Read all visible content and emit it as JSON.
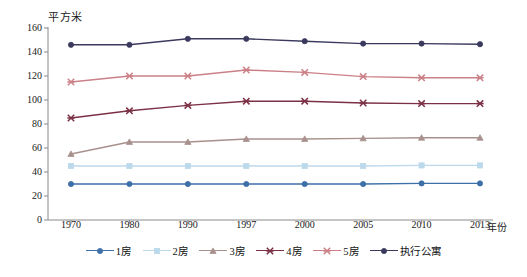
{
  "chart_data": {
    "type": "line",
    "title": "",
    "xlabel": "年份",
    "ylabel": "平方米",
    "grid": false,
    "legend_position": "bottom",
    "categories": [
      "1970",
      "1980",
      "1990",
      "1997",
      "2000",
      "2005",
      "2010",
      "2013"
    ],
    "ylim": [
      0,
      160
    ],
    "yticks": [
      "0",
      "20",
      "40",
      "60",
      "80",
      "100",
      "120",
      "140",
      "160"
    ],
    "series": [
      {
        "name": "1房",
        "color": "#3d6fa8",
        "marker": "circle",
        "values": [
          30,
          30,
          30,
          30,
          30,
          30,
          30.5,
          30.5
        ]
      },
      {
        "name": "2房",
        "color": "#bcd9ec",
        "marker": "square",
        "values": [
          45,
          45,
          45,
          45,
          45,
          45,
          45.5,
          45.5
        ]
      },
      {
        "name": "3房",
        "color": "#a8918d",
        "marker": "triangle",
        "values": [
          55,
          65,
          65,
          67.5,
          67.5,
          68,
          68.5,
          68.5
        ]
      },
      {
        "name": "4房",
        "color": "#7b3045",
        "marker": "cross",
        "values": [
          85,
          91,
          95.5,
          99,
          99,
          97.5,
          97,
          97
        ]
      },
      {
        "name": "5房",
        "color": "#cb8087",
        "marker": "cross",
        "values": [
          115,
          120,
          120,
          125,
          123,
          119.5,
          118.5,
          118.5
        ]
      },
      {
        "name": "执行公寓",
        "color": "#3b3a5e",
        "marker": "circle",
        "values": [
          146,
          146,
          151,
          151,
          149,
          147,
          147,
          146.5
        ]
      }
    ]
  },
  "axis": {
    "y_title": "平方米",
    "x_title": "年份"
  },
  "legend": {
    "items": [
      {
        "label": "1房"
      },
      {
        "label": "2房"
      },
      {
        "label": "3房"
      },
      {
        "label": "4房"
      },
      {
        "label": "5房"
      },
      {
        "label": "执行公寓"
      }
    ]
  }
}
